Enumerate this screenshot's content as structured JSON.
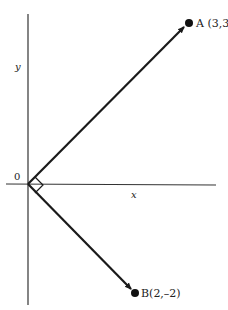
{
  "diagram": {
    "type": "coordinate-vectors",
    "axes": {
      "x_label": "x",
      "y_label": "y",
      "origin_label": "0"
    },
    "points": [
      {
        "id": "A",
        "label": "A (3,3)",
        "coords": [
          3,
          3
        ]
      },
      {
        "id": "B",
        "label": "B(2,–2)",
        "coords": [
          2,
          -2
        ]
      }
    ],
    "vectors": [
      {
        "from": "origin",
        "to": "A"
      },
      {
        "from": "origin",
        "to": "B"
      }
    ],
    "annotations": {
      "right_angle_at_origin": true
    },
    "colors": {
      "stroke": "#1a1a1a",
      "axis": "#333333",
      "background": "#ffffff"
    }
  }
}
